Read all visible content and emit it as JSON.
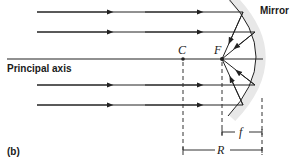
{
  "diagram": {
    "title_tag": "(b)",
    "labels": {
      "mirror": "Mirror",
      "principal_axis": "Principal axis",
      "center_of_curvature": "C",
      "focal_point": "F",
      "focal_length": "f",
      "radius": "R"
    },
    "colors": {
      "line": "#222222",
      "mirror_glow": "#e6e6e6",
      "background": "#ffffff"
    }
  }
}
